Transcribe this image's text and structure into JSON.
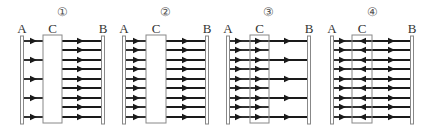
{
  "figure": {
    "line_color": "#1a1a1a",
    "plate_color": "#888888",
    "panels": [
      {
        "number": "①",
        "labels": {
          "a": "A",
          "b": "B",
          "c": "C"
        },
        "c_style": "solid-filled",
        "plate_a_x": 22,
        "plate_b_x": 103,
        "c_box": [
          43,
          62
        ],
        "left_lines": [
          41,
          60,
          79,
          98,
          117
        ],
        "right_lines": [
          41,
          50,
          60,
          69,
          79,
          88,
          98,
          107,
          117
        ],
        "inside_lines": [],
        "inside_dir": "none",
        "left_arrow_x": 33,
        "right_arrow_x": 80,
        "inside_arrow_x": 0
      },
      {
        "number": "②",
        "labels": {
          "a": "A",
          "b": "B",
          "c": "C"
        },
        "c_style": "solid-filled",
        "plate_a_x": 124,
        "plate_b_x": 207,
        "c_box": [
          146,
          166
        ],
        "left_lines": [
          41,
          50,
          60,
          69,
          79,
          88,
          98,
          107,
          117
        ],
        "right_lines": [
          41,
          50,
          60,
          69,
          79,
          88,
          98,
          107,
          117
        ],
        "inside_lines": [],
        "inside_dir": "none",
        "left_arrow_x": 136,
        "right_arrow_x": 185,
        "inside_arrow_x": 0
      },
      {
        "number": "③",
        "labels": {
          "a": "A",
          "b": "B",
          "c": "C"
        },
        "c_style": "outline",
        "plate_a_x": 228,
        "plate_b_x": 309,
        "c_box": [
          250,
          269
        ],
        "left_lines": [
          41,
          50,
          60,
          69,
          79,
          88,
          98,
          107,
          117
        ],
        "right_lines": [
          41,
          60,
          79,
          98,
          117
        ],
        "inside_lines": [
          41,
          50,
          60,
          69,
          79,
          88,
          98,
          107,
          117
        ],
        "inside_dir": "right",
        "left_arrow_x": 238,
        "right_arrow_x": 287,
        "inside_arrow_x": 258
      },
      {
        "number": "④",
        "labels": {
          "a": "A",
          "b": "B",
          "c": "C"
        },
        "c_style": "outline",
        "plate_a_x": 332,
        "plate_b_x": 412,
        "c_box": [
          352,
          372
        ],
        "left_lines": [
          41,
          50,
          60,
          69,
          79,
          88,
          98,
          107,
          117
        ],
        "right_lines": [
          41,
          50,
          60,
          69,
          79,
          88,
          98,
          107,
          117
        ],
        "inside_lines": [
          41,
          50,
          60,
          69,
          79,
          88,
          98,
          107,
          117
        ],
        "inside_dir": "left",
        "left_arrow_x": 342,
        "right_arrow_x": 391,
        "inside_arrow_x": 363
      }
    ]
  }
}
